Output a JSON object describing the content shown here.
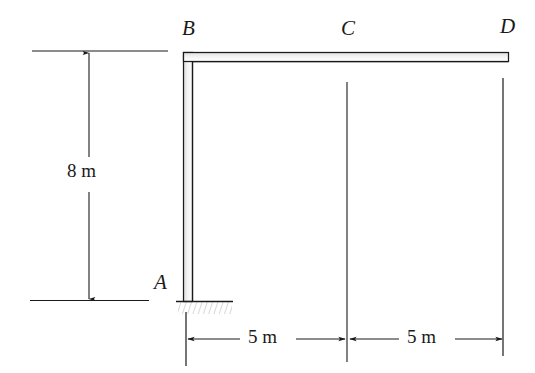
{
  "figure": {
    "kind": "structural-frame-diagram",
    "width": 535,
    "height": 373,
    "background_color": "#ffffff",
    "ink_color": "#1a1a1a",
    "member_fill_color": "#e8e8e8",
    "hatch_color": "#bdbdbd"
  },
  "nodes": [
    {
      "id": "A",
      "label": "A",
      "x": 188,
      "y": 301,
      "label_x": 154,
      "label_y": 272
    },
    {
      "id": "B",
      "label": "B",
      "x": 188,
      "y": 57,
      "label_x": 182,
      "label_y": 18
    },
    {
      "id": "C",
      "label": "C",
      "x": 347,
      "y": 57,
      "label_x": 341,
      "label_y": 18
    },
    {
      "id": "D",
      "label": "D",
      "x": 508,
      "y": 57,
      "label_x": 500,
      "label_y": 16
    }
  ],
  "members": [
    {
      "id": "AB",
      "from": "A",
      "to": "B",
      "orientation": "vertical",
      "length_label": "8 m"
    },
    {
      "id": "BC",
      "from": "B",
      "to": "C",
      "orientation": "horizontal",
      "length_label": "5 m"
    },
    {
      "id": "CD",
      "from": "C",
      "to": "D",
      "orientation": "horizontal",
      "length_label": "5 m"
    }
  ],
  "support": {
    "node": "A",
    "type": "fixed",
    "base_line_x1": 176,
    "base_line_x2": 233,
    "base_line_y": 301
  },
  "dimensions": {
    "vertical": [
      {
        "id": "height-8m",
        "value": "8 m",
        "label": "8 m",
        "label_x": 67,
        "label_y": 161,
        "line_x": 89,
        "y_top": 52,
        "y_bottom": 300,
        "ext_top": {
          "x1": 32,
          "x2": 168,
          "y": 51
        },
        "ext_bottom": {
          "x1": 30,
          "x2": 149,
          "y": 300
        }
      }
    ],
    "horizontal": [
      {
        "id": "span-bc-5m",
        "value": "5 m",
        "label": "5 m",
        "label_x": 248,
        "label_y": 327,
        "line_y": 339,
        "x_left": 186,
        "x_right": 345
      },
      {
        "id": "span-cd-5m",
        "value": "5 m",
        "label": "5 m",
        "label_x": 407,
        "label_y": 327,
        "line_y": 339,
        "x_left": 349,
        "x_right": 502
      }
    ],
    "extension_lines": [
      {
        "id": "ext-A",
        "x": 186,
        "y1": 312,
        "y2": 366
      },
      {
        "id": "ext-C",
        "x": 347,
        "y1": 82,
        "y2": 362
      },
      {
        "id": "ext-D",
        "x": 503,
        "y1": 78,
        "y2": 356
      }
    ]
  }
}
